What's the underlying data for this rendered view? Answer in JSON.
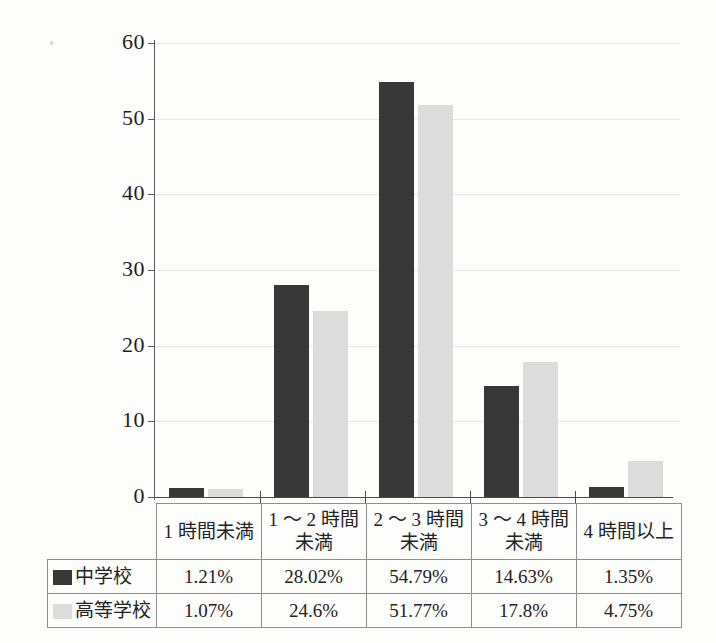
{
  "chart_data": {
    "type": "bar",
    "title": "",
    "subtitle": "",
    "xlabel": "",
    "ylabel": "",
    "ylim": [
      0,
      60
    ],
    "yticks": [
      0,
      10,
      20,
      30,
      40,
      50,
      60
    ],
    "ytick_labels": [
      "0",
      "10",
      "20",
      "30",
      "40",
      "50",
      "60"
    ],
    "grid": true,
    "legend_position": "table-left",
    "categories": [
      "1 時間未満",
      "1 ～ 2 時間\n未満",
      "2 ～ 3 時間\n未満",
      "3 ～ 4 時間\n未満",
      "4 時間以上"
    ],
    "category_lines": [
      [
        "1 時間未満",
        ""
      ],
      [
        "1 ～ 2 時間",
        "未満"
      ],
      [
        "2 ～ 3 時間",
        "未満"
      ],
      [
        "3 ～ 4 時間",
        "未満"
      ],
      [
        "4 時間以上",
        ""
      ]
    ],
    "series": [
      {
        "name": "中学校",
        "color": "#383838",
        "values": [
          1.21,
          28.02,
          54.79,
          14.63,
          1.35
        ],
        "labels": [
          "1.21%",
          "28.02%",
          "54.79%",
          "14.63%",
          "1.35%"
        ]
      },
      {
        "name": "高等学校",
        "color": "#dcdcdc",
        "values": [
          1.07,
          24.6,
          51.77,
          17.8,
          4.75
        ],
        "labels": [
          "1.07%",
          "24.6%",
          "51.77%",
          "17.8%",
          "4.75%"
        ]
      }
    ]
  },
  "table": {
    "row_header_series_0": "中学校",
    "row_header_series_1": "高等学校"
  }
}
